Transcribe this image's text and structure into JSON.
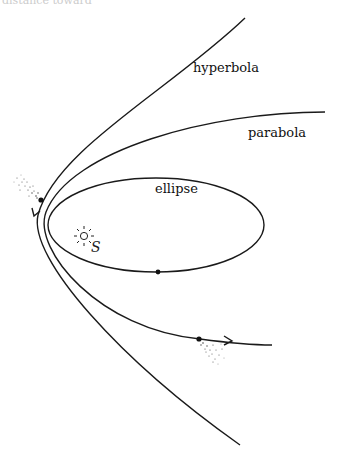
{
  "figure": {
    "top_cut_text": "distance toward",
    "labels": {
      "hyperbola": "hyperbola",
      "parabola": "parabola",
      "ellipse": "ellipse",
      "sun": "S"
    },
    "colors": {
      "line": "#1a1a1a",
      "background": "#ffffff"
    }
  }
}
